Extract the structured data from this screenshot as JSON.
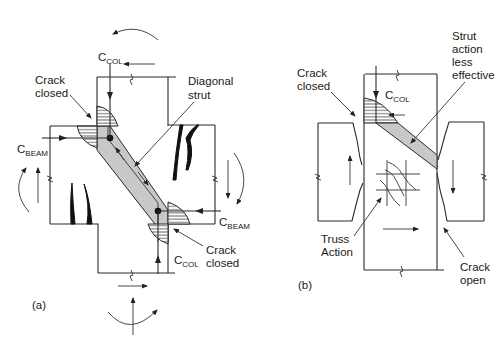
{
  "figure": {
    "panels": [
      {
        "id": "a",
        "panel_label": "(a)",
        "labels": {
          "c_col_top": {
            "main": "C",
            "sub": "COL"
          },
          "c_col_bottom": {
            "main": "C",
            "sub": "COL"
          },
          "c_beam_left": {
            "main": "C",
            "sub": "BEAM"
          },
          "c_beam_right": {
            "main": "C",
            "sub": "BEAM"
          },
          "crack_closed_top": [
            "Crack",
            "closed"
          ],
          "crack_closed_bottom": [
            "Crack",
            "closed"
          ],
          "diagonal_strut": [
            "Diagonal",
            "strut"
          ]
        }
      },
      {
        "id": "b",
        "panel_label": "(b)",
        "labels": {
          "c_col_top": {
            "main": "C",
            "sub": "COL"
          },
          "crack_closed": [
            "Crack",
            "closed"
          ],
          "strut_less_effective": [
            "Strut",
            "action",
            "less",
            "effective"
          ],
          "truss_action": [
            "Truss",
            "Action"
          ],
          "crack_open": [
            "Crack",
            "open"
          ]
        }
      }
    ],
    "colors": {
      "line": "#2a2a2a",
      "strut_fill": "#c8c8c8",
      "background": "#ffffff"
    }
  }
}
